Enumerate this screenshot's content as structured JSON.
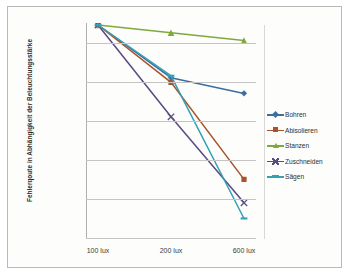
{
  "chart_data": {
    "type": "line",
    "title": "",
    "xlabel": "",
    "ylabel": "Fehlerqoute in Abhängigkeit der Beleuchtungsstärke",
    "categories": [
      "100 lux",
      "200 lux",
      "600 lux"
    ],
    "ylim": [
      45,
      100
    ],
    "ytick_labels": [
      "95%",
      "85%",
      "75%",
      "65%",
      "55%",
      "45%"
    ],
    "ytick_values": [
      95,
      85,
      75,
      65,
      55,
      45
    ],
    "grid": true,
    "legend_position": "right",
    "series": [
      {
        "name": "Bohren",
        "values": [
          99.5,
          86.0,
          82.0
        ],
        "color": "#3c6e9e",
        "marker": "diamond"
      },
      {
        "name": "Abisolieren",
        "values": [
          99.5,
          84.8,
          60.0
        ],
        "color": "#a8532b",
        "marker": "square"
      },
      {
        "name": "Stanzen",
        "values": [
          99.5,
          97.5,
          95.5
        ],
        "color": "#7fa93c",
        "marker": "triangle"
      },
      {
        "name": "Zuschneiden",
        "values": [
          99.5,
          76.0,
          54.0
        ],
        "color": "#5a4a84",
        "marker": "cross"
      },
      {
        "name": "Sägen",
        "values": [
          99.5,
          86.5,
          50.0
        ],
        "color": "#35a0b5",
        "marker": "dash"
      }
    ]
  },
  "axis": {
    "y_title": "Fehlerqoute in Abhängigkeit der Beleuchtungsstärke"
  }
}
